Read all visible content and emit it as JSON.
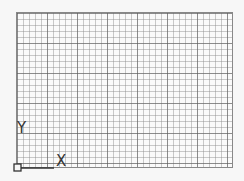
{
  "viewport": {
    "type": "cad-drawing-canvas",
    "grid": {
      "minor_spacing_px": 6,
      "major_every": 5,
      "visible": true
    },
    "background_color": "#f7f7f7",
    "grid_color": "#8c8c8c"
  },
  "ucs_icon": {
    "x_label": "X",
    "y_label": "Y",
    "color": "#333333"
  }
}
